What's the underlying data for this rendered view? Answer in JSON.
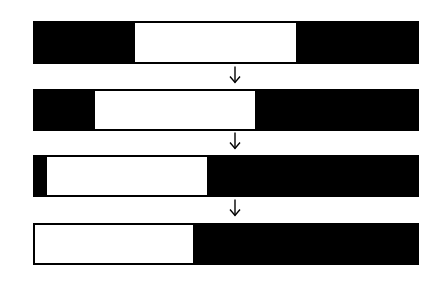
{
  "diagram": {
    "colors": {
      "fill": "#000000",
      "window": "#ffffff",
      "background": "#ffffff"
    },
    "bars": [
      {
        "step": 1,
        "left": 33,
        "right": 419,
        "top": 21,
        "bottom": 64,
        "window_start": 135,
        "window_end": 296
      },
      {
        "step": 2,
        "left": 33,
        "right": 419,
        "top": 89,
        "bottom": 131,
        "window_start": 95,
        "window_end": 255
      },
      {
        "step": 3,
        "left": 33,
        "right": 419,
        "top": 155,
        "bottom": 197,
        "window_start": 47,
        "window_end": 207
      },
      {
        "step": 4,
        "left": 33,
        "right": 419,
        "top": 223,
        "bottom": 265,
        "window_start": 35,
        "window_end": 193
      }
    ],
    "arrows": [
      {
        "icon": "down-arrow-icon",
        "x": 235,
        "top": 66,
        "bottom": 83
      },
      {
        "icon": "down-arrow-icon",
        "x": 235,
        "top": 132,
        "bottom": 149
      },
      {
        "icon": "down-arrow-icon",
        "x": 235,
        "top": 199,
        "bottom": 216
      }
    ]
  }
}
